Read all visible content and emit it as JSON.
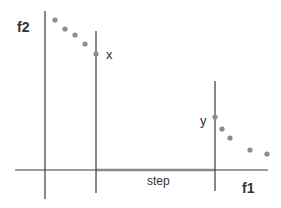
{
  "diagram": {
    "labels": {
      "f2": "f2",
      "f1": "f1",
      "x": "x",
      "y": "y",
      "step": "step"
    },
    "colors": {
      "line": "#3a3a3a",
      "step_segment": "#8a8a8a",
      "dot": "#8c8c8c",
      "text": "#333333"
    },
    "points_upper_left": [
      [
        55,
        20
      ],
      [
        65,
        29
      ],
      [
        75,
        35
      ],
      [
        85,
        44
      ],
      [
        96,
        54
      ]
    ],
    "points_lower_right": [
      [
        215,
        117
      ],
      [
        222,
        129
      ],
      [
        230,
        138
      ],
      [
        250,
        150
      ],
      [
        267,
        154
      ]
    ]
  }
}
